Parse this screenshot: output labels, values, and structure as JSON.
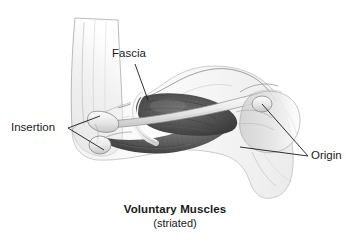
{
  "figure": {
    "background_color": "#ffffff",
    "line_color": "#1a1a1a",
    "width": 350,
    "height": 249
  },
  "labels": {
    "fascia": "Fascia",
    "insertion": "Insertion",
    "origin": "Origin"
  },
  "caption": {
    "title": "Voluntary Muscles",
    "subtitle": "(striated)"
  },
  "anatomy": {
    "regions": [
      "forearm",
      "elbow-joint",
      "biceps-muscle-belly",
      "triceps-muscle-belly",
      "humerus",
      "shoulder-joint",
      "scapula",
      "deltoid-contour"
    ],
    "palette": {
      "skin_outline": "#6e6e6e",
      "skin_fill": "#f4f4f4",
      "bone_fill": "#e3e3e3",
      "bone_outline": "#8a8a8a",
      "muscle_dark": "#4a4a4a",
      "muscle_mid": "#6b6b6b",
      "muscle_light": "#9a9a9a",
      "fascia_band": "#f0f0f0",
      "shadow": "#bcbcbc"
    }
  }
}
